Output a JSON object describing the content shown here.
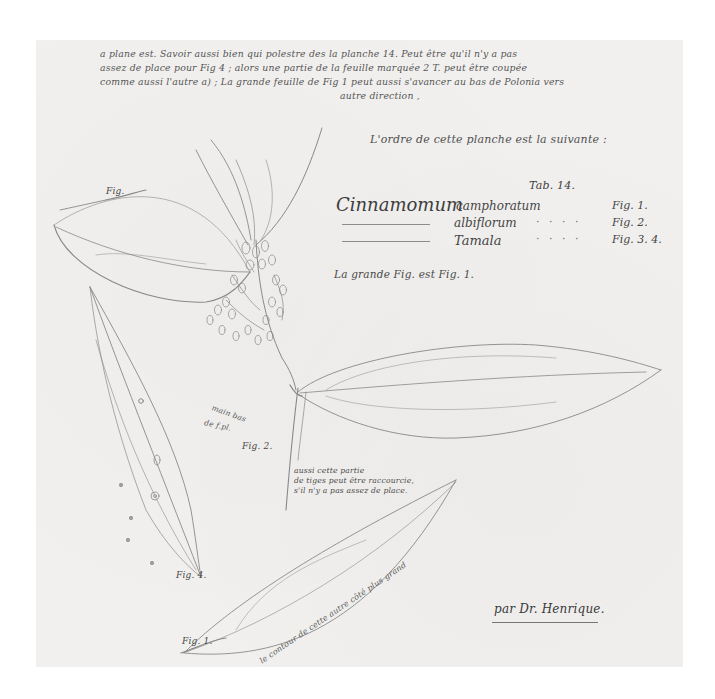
{
  "document": {
    "type": "botanical-manuscript-plate",
    "paper_color": "#f1f0ee",
    "ink_color": "#4a4a4a",
    "pencil_color": "#8a8a8a"
  },
  "header_note": {
    "lines": [
      "a plane est. Savoir aussi bien qui polestre des la planche 14. Peut être qu'il n'y a pas",
      "assez de place pour Fig 4 ; alors une partie de la feuille marquée 2 T. peut être coupée",
      "comme aussi l'autre a) ; La grande feuille de Fig 1 peut aussi s'avancer au bas de Polonia vers"
    ],
    "last_line": "autre direction ,"
  },
  "explication": {
    "heading": "L'ordre de cette planche est la suivante :",
    "tab_label": "Tab. 14.",
    "species": [
      {
        "genus": "Cinnamomum",
        "epithet": "camphoratum",
        "figure": "Fig. 1."
      },
      {
        "genus": "",
        "epithet": "albiflorum",
        "figure": "Fig. 2."
      },
      {
        "genus": "",
        "epithet": "Tamala",
        "figure": "Fig. 3. 4."
      }
    ],
    "dots": "· · · ·",
    "grande_fig": "La grande Fig. est Fig. 1."
  },
  "figure_labels": {
    "fig1_top_mark": "Fig.",
    "fig_stem_note_line1": "main bas",
    "fig_stem_note_line2": "de f.pl.",
    "fig2": "Fig. 2.",
    "fig4": "Fig. 4.",
    "fig1_bottom": "Fig. 1."
  },
  "middle_note": {
    "lines": [
      "aussi cette partie",
      "de tiges peut être raccourcie,",
      "s'il n'y a pas assez de place."
    ]
  },
  "bottom_rotated_note": "le contour de cette autre côté plus grand",
  "signature": "par Dr. Henrique."
}
